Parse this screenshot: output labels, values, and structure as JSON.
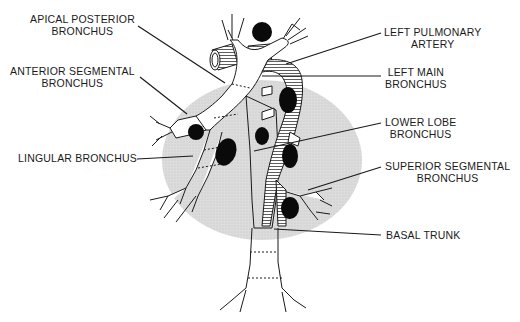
{
  "diagram": {
    "colors": {
      "shading": "#d9d9d9",
      "lymph_nodes": "#0a0a0a",
      "lines": "#1a1a1a",
      "background": "#ffffff"
    },
    "labels_left": [
      {
        "id": "apical-posterior",
        "line1": "APICAL POSTERIOR",
        "line2": "BRONCHUS"
      },
      {
        "id": "anterior-segmental",
        "line1": "ANTERIOR SEGMENTAL",
        "line2": "BRONCHUS"
      },
      {
        "id": "lingular",
        "line1": "LINGULAR BRONCHUS",
        "line2": ""
      }
    ],
    "labels_right": [
      {
        "id": "left-pulmonary-artery",
        "line1": "LEFT PULMONARY",
        "line2": "ARTERY"
      },
      {
        "id": "left-main",
        "line1": "LEFT MAIN",
        "line2": "BRONCHUS"
      },
      {
        "id": "lower-lobe",
        "line1": "LOWER LOBE",
        "line2": "BRONCHUS"
      },
      {
        "id": "superior-segmental",
        "line1": "SUPERIOR SEGMENTAL",
        "line2": "BRONCHUS"
      },
      {
        "id": "basal-trunk",
        "line1": "BASAL TRUNK",
        "line2": ""
      }
    ]
  }
}
